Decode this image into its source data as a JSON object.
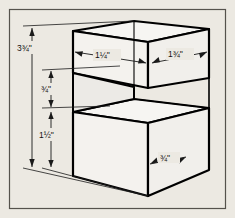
{
  "figure": {
    "name": "isometric-stepped-block",
    "type": "isometric-technical-drawing",
    "units": "inches",
    "background_color": "#ece9e2",
    "frame_color": "#4a4a4a",
    "line_color": "#000000",
    "face_fill": "#f4f2ee"
  },
  "dimensions": [
    {
      "id": "overall-height",
      "label": "3¾\"",
      "whole": "3",
      "fraction": "¾",
      "inch_mark": "\"",
      "value": 3.75,
      "orientation": "vertical",
      "position": "left-outer",
      "describes": "overall height of part"
    },
    {
      "id": "top-width-left",
      "label": "1¼\"",
      "whole": "1",
      "fraction": "¼",
      "inch_mark": "\"",
      "value": 1.25,
      "orientation": "horizontal-isometric",
      "position": "top-front-left",
      "describes": "top slab front-left width"
    },
    {
      "id": "top-width-right",
      "label": "1¾\"",
      "whole": "1",
      "fraction": "¾",
      "inch_mark": "\"",
      "value": 1.75,
      "orientation": "horizontal-isometric",
      "position": "top-front-right",
      "describes": "top slab front-right width"
    },
    {
      "id": "step-height",
      "label": "¾\"",
      "whole": "",
      "fraction": "¾",
      "inch_mark": "\"",
      "value": 0.75,
      "orientation": "vertical",
      "position": "left-inner-upper",
      "describes": "height of upper slab / step riser"
    },
    {
      "id": "lower-height",
      "label": "1½\"",
      "whole": "1",
      "fraction": "½",
      "inch_mark": "\"",
      "value": 1.5,
      "orientation": "vertical",
      "position": "left-inner-lower",
      "describes": "height of lower block"
    },
    {
      "id": "step-depth",
      "label": "¾\"",
      "whole": "",
      "fraction": "¾",
      "inch_mark": "\"",
      "value": 0.75,
      "orientation": "isometric-depth",
      "position": "lower-right",
      "describes": "depth of step ledge at right face"
    }
  ]
}
